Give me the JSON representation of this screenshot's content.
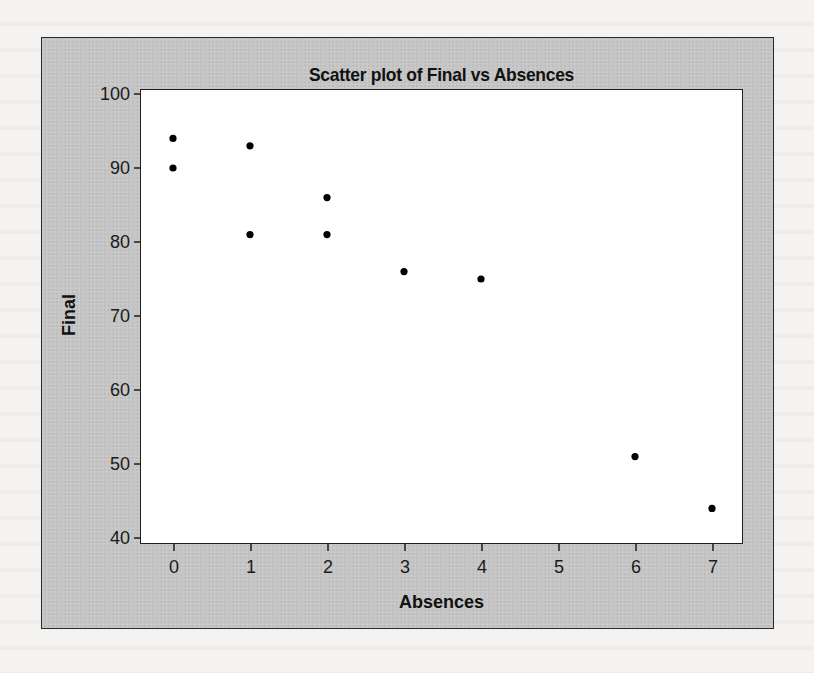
{
  "chart_data": {
    "type": "scatter",
    "title": "Scatter plot of Final vs Absences",
    "xlabel": "Absences",
    "ylabel": "Final",
    "xlim": [
      -0.43,
      7.4
    ],
    "ylim": [
      40,
      100
    ],
    "x_ticks": [
      0,
      1,
      2,
      3,
      4,
      5,
      6,
      7
    ],
    "y_ticks": [
      40,
      50,
      60,
      70,
      80,
      90,
      100
    ],
    "grid": false,
    "legend": null,
    "series": [
      {
        "name": "Final vs Absences",
        "marker": "filled-circle",
        "color": "#000000",
        "points": [
          {
            "x": 0,
            "y": 94
          },
          {
            "x": 0,
            "y": 90
          },
          {
            "x": 1,
            "y": 93
          },
          {
            "x": 1,
            "y": 81
          },
          {
            "x": 2,
            "y": 86
          },
          {
            "x": 2,
            "y": 81
          },
          {
            "x": 3,
            "y": 76
          },
          {
            "x": 4,
            "y": 75
          },
          {
            "x": 6,
            "y": 51
          },
          {
            "x": 7,
            "y": 44
          }
        ]
      }
    ]
  },
  "colors": {
    "frame_background": "#c6c6c6",
    "plot_background": "#ffffff",
    "marker": "#000000",
    "axis": "#1e1e1e"
  }
}
